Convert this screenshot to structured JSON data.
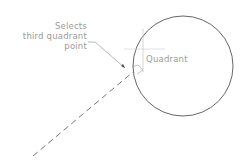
{
  "callout": {
    "line1": "Selects",
    "line2": "third quadrant",
    "line3": "point"
  },
  "quadrant_label": "Quadrant",
  "colors": {
    "circle": "#555555",
    "leader": "#999999",
    "dashed": "#666666",
    "label": "#9a9a9a"
  }
}
